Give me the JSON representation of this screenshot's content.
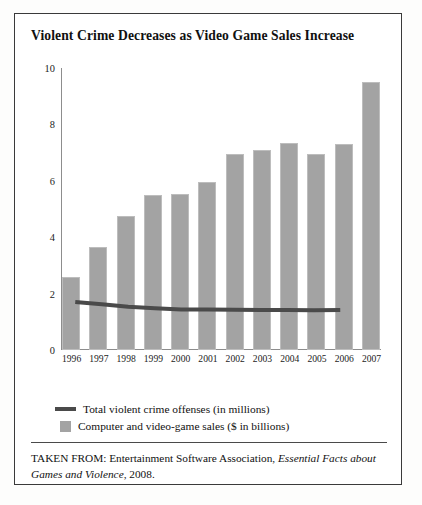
{
  "figure": {
    "title": "Violent Crime Decreases as Video Game Sales Increase",
    "source_prefix": "TAKEN FROM: Entertainment Software Association, ",
    "source_italic": "Essential Facts about Games and Violence",
    "source_suffix": ", 2008."
  },
  "legend": {
    "line_label": "Total violent crime offenses (in millions)",
    "bar_label": "Computer and video-game sales ($ in billions)",
    "line_color": "#4a4a4a",
    "bar_color": "#a3a3a3"
  },
  "chart_data": {
    "type": "bar",
    "title": "Violent Crime Decreases as Video Game Sales Increase",
    "xlabel": "",
    "ylabel": "",
    "ylim": [
      0,
      10
    ],
    "yticks": [
      0,
      2,
      4,
      6,
      8,
      10
    ],
    "grid": false,
    "legend_position": "below-plot",
    "categories": [
      "1996",
      "1997",
      "1998",
      "1999",
      "2000",
      "2001",
      "2002",
      "2003",
      "2004",
      "2005",
      "2006",
      "2007"
    ],
    "series": [
      {
        "name": "Computer and video-game sales ($ in billions)",
        "type": "bar",
        "color": "#a3a3a3",
        "values": [
          2.6,
          3.65,
          4.75,
          5.5,
          5.55,
          5.95,
          6.95,
          7.1,
          7.35,
          6.95,
          7.3,
          9.5
        ]
      },
      {
        "name": "Total violent crime offenses (in millions)",
        "type": "line",
        "color": "#4a4a4a",
        "x": [
          "1996",
          "1997",
          "1998",
          "1999",
          "2000",
          "2001",
          "2002",
          "2003",
          "2004",
          "2005",
          "2006"
        ],
        "values": [
          1.7,
          1.62,
          1.53,
          1.48,
          1.44,
          1.44,
          1.43,
          1.42,
          1.42,
          1.41,
          1.42
        ]
      }
    ]
  }
}
